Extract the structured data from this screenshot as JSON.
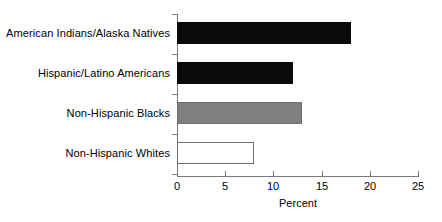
{
  "chart_data": {
    "type": "bar",
    "orientation": "horizontal",
    "title": "",
    "xlabel": "Percent",
    "ylabel": "",
    "categories": [
      "American Indians/Alaska Natives",
      "Hispanic/Latino Americans",
      "Non-Hispanic Blacks",
      "Non-Hispanic Whites"
    ],
    "values": [
      18,
      12,
      13,
      8
    ],
    "bar_styles": [
      "black",
      "black",
      "gray",
      "white"
    ],
    "xlim": [
      0,
      25
    ],
    "xticks": [
      0,
      5,
      10,
      15,
      20,
      25
    ],
    "xtick_labels": [
      "0",
      "5",
      "10",
      "15",
      "20",
      "25"
    ],
    "grid": false,
    "legend": null,
    "colors": {
      "black": "#0a0a0a",
      "gray": "#808080",
      "white": "#ffffff",
      "axis": "#7a7a7a",
      "text": "#000000",
      "background": "#ffffff"
    }
  }
}
